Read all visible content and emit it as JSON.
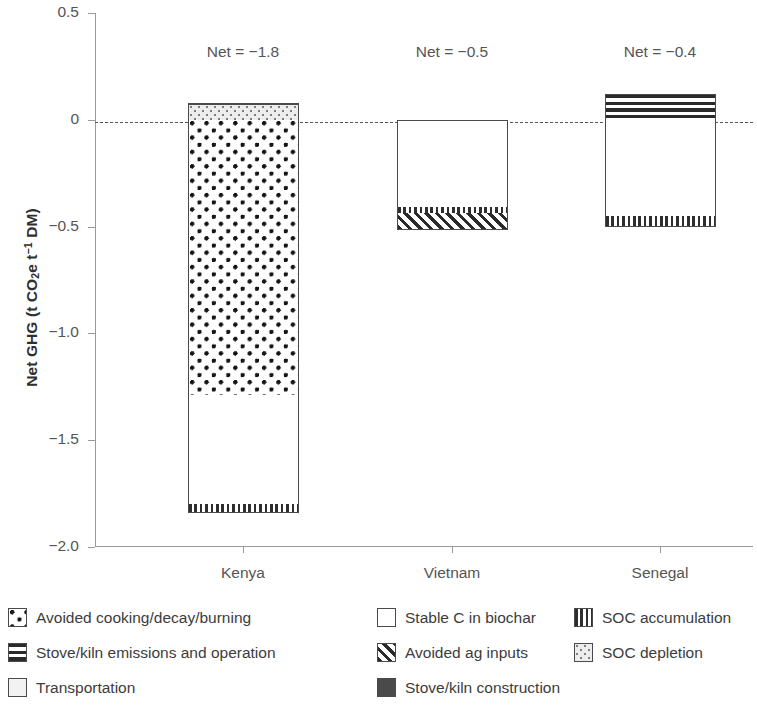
{
  "chart_data": {
    "type": "bar",
    "subtype": "stacked-diverging",
    "title": "",
    "xlabel": "",
    "ylabel": "Net GHG (t CO2e t-1 DM)",
    "ylabel_parts": {
      "pre": "Net GHG (t CO",
      "sub1": "2",
      "mid": "e t",
      "sup1": "−1",
      "post": " DM)"
    },
    "ylim": [
      -2.0,
      0.5
    ],
    "yticks": [
      0.5,
      0,
      -0.5,
      -1.0,
      -1.5,
      -2.0
    ],
    "ytick_labels": [
      "0.5",
      "0",
      "−0.5",
      "−1.0",
      "−1.5",
      "−2.0"
    ],
    "grid": false,
    "zero_line": true,
    "zero_line_style": "dashed",
    "legend_position": "below",
    "categories": [
      "Kenya",
      "Vietnam",
      "Senegal"
    ],
    "net_labels": [
      "Net = −1.8",
      "Net = −0.5",
      "Net = −0.4"
    ],
    "net_values": [
      -1.8,
      -0.5,
      -0.4
    ],
    "series": [
      {
        "name": "Avoided cooking/decay/burning",
        "pattern": "dots",
        "values": [
          -1.29,
          0,
          0
        ]
      },
      {
        "name": "Stable C in biochar",
        "pattern": "white",
        "values": [
          -0.51,
          -0.41,
          -0.45
        ]
      },
      {
        "name": "SOC accumulation",
        "pattern": "vertical-lines",
        "values": [
          -0.04,
          -0.02,
          -0.05
        ]
      },
      {
        "name": "Avoided ag inputs",
        "pattern": "diagonal-hatch",
        "values": [
          0,
          -0.08,
          0
        ]
      },
      {
        "name": "SOC depletion",
        "pattern": "fine-dots-gray",
        "values": [
          0.07,
          0,
          0
        ]
      },
      {
        "name": "Stove/kiln construction",
        "pattern": "solid-dark",
        "values": [
          0.01,
          0,
          0
        ]
      },
      {
        "name": "Stove/kiln emissions and operation",
        "pattern": "horizontal-lines",
        "values": [
          0,
          0,
          0.12
        ]
      },
      {
        "name": "Transportation",
        "pattern": "light-gray",
        "values": [
          0,
          0,
          0
        ]
      }
    ],
    "bars": [
      {
        "category": "Kenya",
        "net": -1.8,
        "net_label": "Net = −1.8",
        "segments": [
          {
            "label": "Stove/kiln construction",
            "pattern": "construct",
            "from": 0.07,
            "to": 0.08
          },
          {
            "label": "SOC depletion",
            "pattern": "socdep",
            "from": 0.0,
            "to": 0.07
          },
          {
            "label": "Avoided cooking/decay/burning",
            "pattern": "dots",
            "from": -1.29,
            "to": 0.0
          },
          {
            "label": "Stable C in biochar",
            "pattern": "white",
            "from": -1.8,
            "to": -1.29
          },
          {
            "label": "SOC accumulation",
            "pattern": "vlines",
            "from": -1.84,
            "to": -1.8
          }
        ]
      },
      {
        "category": "Vietnam",
        "net": -0.5,
        "net_label": "Net = −0.5",
        "segments": [
          {
            "label": "Stable C in biochar",
            "pattern": "white",
            "from": -0.41,
            "to": 0.0
          },
          {
            "label": "SOC accumulation",
            "pattern": "vlines",
            "from": -0.435,
            "to": -0.41
          },
          {
            "label": "Avoided ag inputs",
            "pattern": "diag",
            "from": -0.515,
            "to": -0.435
          }
        ]
      },
      {
        "category": "Senegal",
        "net": -0.4,
        "net_label": "Net = −0.4",
        "segments": [
          {
            "label": "Stove/kiln emissions and operation",
            "pattern": "hlines",
            "from": 0.0,
            "to": 0.12
          },
          {
            "label": "Stable C in biochar",
            "pattern": "white",
            "from": -0.45,
            "to": 0.0
          },
          {
            "label": "SOC accumulation",
            "pattern": "vlines",
            "from": -0.5,
            "to": -0.45
          }
        ]
      }
    ]
  },
  "legend": {
    "rows": [
      [
        {
          "label": "Avoided cooking/decay/burning",
          "pattern": "dots",
          "width": 369
        },
        {
          "label": "Stable C in biochar",
          "pattern": "white",
          "width": 197
        },
        {
          "label": "SOC accumulation",
          "pattern": "vlines",
          "width": 180
        }
      ],
      [
        {
          "label": "Stove/kiln emissions and operation",
          "pattern": "hlines",
          "width": 369
        },
        {
          "label": "Avoided ag inputs",
          "pattern": "diag",
          "width": 197
        },
        {
          "label": "SOC depletion",
          "pattern": "socdep",
          "width": 180
        }
      ],
      [
        {
          "label": "Transportation",
          "pattern": "transport",
          "width": 369
        },
        {
          "label": "Stove/kiln construction",
          "pattern": "construct",
          "width": 197
        }
      ]
    ]
  }
}
